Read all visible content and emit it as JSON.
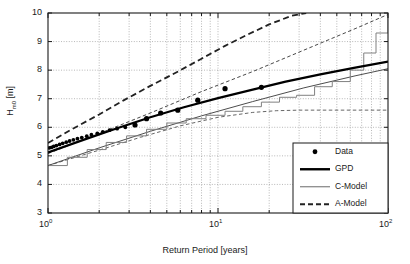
{
  "chart_data": {
    "type": "line",
    "title": "",
    "xlabel": "Return Period [years]",
    "ylabel": "H_m0 [m]",
    "xscale": "log",
    "yscale": "linear",
    "xlim": [
      1,
      100
    ],
    "ylim": [
      3,
      10
    ],
    "grid": true,
    "grid_style": "dotted",
    "ytick_labels": [
      "3",
      "4",
      "5",
      "6",
      "7",
      "8",
      "9",
      "10"
    ],
    "ytick_values": [
      3,
      4,
      5,
      6,
      7,
      8,
      9,
      10
    ],
    "xtick_labels": [
      "10",
      "10",
      "10"
    ],
    "xtick_exponents": [
      "0",
      "1",
      "2"
    ],
    "xtick_values": [
      1,
      10,
      100
    ],
    "legend": {
      "position": "lower-right",
      "entries": [
        {
          "label": "Data",
          "marker": "circle",
          "color": "#000000"
        },
        {
          "label": "GPD",
          "marker": "thick-line",
          "color": "#000000"
        },
        {
          "label": "C-Model",
          "marker": "thin-line",
          "color": "#777777"
        },
        {
          "label": "A-Model",
          "marker": "dashed-line",
          "color": "#222222"
        }
      ]
    },
    "series": [
      {
        "name": "Data",
        "type": "scatter",
        "color": "#000000",
        "x": [
          1.02,
          1.05,
          1.08,
          1.12,
          1.17,
          1.22,
          1.28,
          1.34,
          1.41,
          1.49,
          1.58,
          1.69,
          1.8,
          1.95,
          2.1,
          2.3,
          2.55,
          2.85,
          3.25,
          3.8,
          4.6,
          5.8,
          7.6,
          11.0,
          18.0
        ],
        "y": [
          5.28,
          5.3,
          5.33,
          5.36,
          5.4,
          5.44,
          5.48,
          5.52,
          5.56,
          5.6,
          5.64,
          5.69,
          5.74,
          5.79,
          5.84,
          5.9,
          5.95,
          6.0,
          6.08,
          6.3,
          6.5,
          6.6,
          6.95,
          7.35,
          7.4
        ]
      },
      {
        "name": "GPD",
        "type": "line",
        "style": "solid-thick",
        "color": "#000000",
        "x": [
          1,
          1.6,
          2.5,
          4,
          6.3,
          10,
          16,
          25,
          40,
          63,
          100
        ],
        "y": [
          5.12,
          5.55,
          5.95,
          6.35,
          6.7,
          7.02,
          7.32,
          7.6,
          7.85,
          8.08,
          8.3
        ]
      },
      {
        "name": "C-Model",
        "type": "step",
        "style": "solid-thin",
        "color": "#808080",
        "x": [
          1,
          1.3,
          1.7,
          2.2,
          2.9,
          3.8,
          5.0,
          6.5,
          8.5,
          11,
          14,
          18,
          23,
          29,
          37,
          47,
          60,
          72,
          85,
          100
        ],
        "y": [
          4.66,
          4.95,
          5.22,
          5.47,
          5.7,
          5.93,
          6.15,
          6.3,
          6.42,
          6.56,
          6.72,
          6.88,
          7.05,
          7.12,
          7.42,
          7.6,
          8.0,
          8.6,
          9.3,
          10.0
        ]
      },
      {
        "name": "A-Model",
        "type": "line",
        "style": "dashed-thick",
        "color": "#222222",
        "x": [
          1,
          1.4,
          2.0,
          2.8,
          4.0,
          5.6,
          8.0,
          11,
          15,
          20,
          27,
          33
        ],
        "y": [
          5.45,
          5.95,
          6.45,
          6.95,
          7.45,
          7.9,
          8.4,
          8.85,
          9.25,
          9.6,
          9.9,
          10.0
        ]
      },
      {
        "name": "A-Model upper bound",
        "type": "line",
        "style": "dashed-thin",
        "color": "#333333",
        "x": [
          1,
          2,
          4,
          8,
          16,
          32,
          64,
          100
        ],
        "y": [
          5.08,
          5.78,
          6.5,
          7.25,
          7.95,
          8.7,
          9.45,
          9.95
        ]
      },
      {
        "name": "A-Model lower bound",
        "type": "line",
        "style": "dashed-thin",
        "color": "#555555",
        "x": [
          1,
          2,
          3.5,
          6,
          10,
          16,
          22,
          30,
          45,
          70,
          100
        ],
        "y": [
          4.66,
          5.2,
          5.65,
          6.05,
          6.35,
          6.52,
          6.58,
          6.6,
          6.6,
          6.6,
          6.6
        ]
      },
      {
        "name": "GPD lower bound",
        "type": "line",
        "style": "solid-thin",
        "color": "#4d4d4d",
        "x": [
          1,
          2,
          4,
          8,
          16,
          32,
          64,
          100
        ],
        "y": [
          4.66,
          5.28,
          5.86,
          6.4,
          6.9,
          7.38,
          7.8,
          8.05
        ]
      }
    ]
  }
}
